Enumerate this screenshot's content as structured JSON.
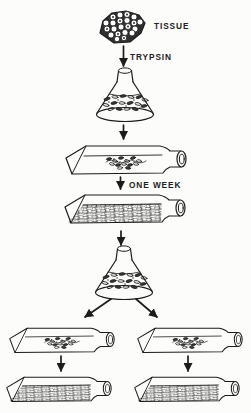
{
  "diagram": {
    "type": "flow-diagram",
    "colors": {
      "background": "#fcfcfb",
      "line": "#1c1c1c",
      "label": "#222222"
    },
    "labels": {
      "tissue": "TISSUE",
      "trypsin": "TRYPSIN",
      "one_week": "ONE WEEK"
    },
    "nodes": [
      {
        "id": "tissue",
        "icon": "tissue-fragment-icon"
      },
      {
        "id": "dissociation-flask",
        "icon": "erlenmeyer-flask-icon"
      },
      {
        "id": "primary-culture-bottle",
        "icon": "culture-bottle-sparse-icon"
      },
      {
        "id": "confluent-culture-bottle",
        "icon": "culture-bottle-confluent-icon"
      },
      {
        "id": "subculture-flask",
        "icon": "erlenmeyer-flask-icon"
      },
      {
        "id": "subculture-bottle-left",
        "icon": "culture-bottle-sparse-icon"
      },
      {
        "id": "subculture-bottle-right",
        "icon": "culture-bottle-sparse-icon"
      },
      {
        "id": "confluent-bottle-left",
        "icon": "culture-bottle-confluent-icon"
      },
      {
        "id": "confluent-bottle-right",
        "icon": "culture-bottle-confluent-icon"
      }
    ]
  }
}
